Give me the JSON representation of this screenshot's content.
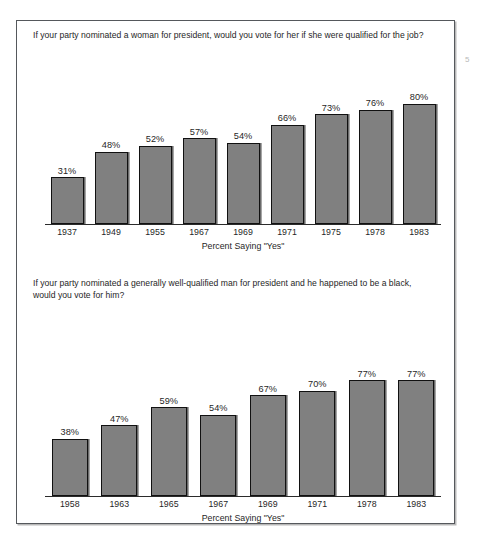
{
  "margin_note": "5",
  "axis_caption": "Percent Saying \"Yes\"",
  "panels": [
    {
      "title": "If your party nominated a woman for president, would you vote for her if she were qualified for the job?",
      "caption": "Percent Saying \"Yes\""
    },
    {
      "title": "If your party nominated a generally well-qualified man for president and he happened to be a black,\nwould you vote for him?",
      "caption": "Percent Saying \"Yes\""
    }
  ],
  "chart_data": [
    {
      "type": "bar",
      "title": "If your party nominated a woman for president, would you vote for her if she were qualified for the job?",
      "xlabel": "Percent Saying \"Yes\"",
      "ylabel": "",
      "ylim": [
        0,
        100
      ],
      "grid": false,
      "legend": "none",
      "categories": [
        "1937",
        "1949",
        "1955",
        "1967",
        "1969",
        "1971",
        "1975",
        "1978",
        "1983"
      ],
      "values": [
        31,
        48,
        52,
        57,
        54,
        66,
        73,
        76,
        80
      ],
      "data_labels": [
        "31%",
        "48%",
        "52%",
        "57%",
        "54%",
        "66%",
        "73%",
        "76%",
        "80%"
      ]
    },
    {
      "type": "bar",
      "title": "If your party nominated a generally well-qualified man for president and he happened to be a black, would you vote for him?",
      "xlabel": "Percent Saying \"Yes\"",
      "ylabel": "",
      "ylim": [
        0,
        100
      ],
      "grid": false,
      "legend": "none",
      "categories": [
        "1958",
        "1963",
        "1965",
        "1967",
        "1969",
        "1971",
        "1978",
        "1983"
      ],
      "values": [
        38,
        47,
        59,
        54,
        67,
        70,
        77,
        77
      ],
      "data_labels": [
        "38%",
        "47%",
        "59%",
        "54%",
        "67%",
        "70%",
        "77%",
        "77%"
      ]
    }
  ],
  "colors": {
    "bar_fill": "#808080",
    "bar_stroke": "#111111",
    "axis": "#2b2b2b",
    "frame": "#55585c",
    "text": "#1f1f1f",
    "background": "#ffffff"
  }
}
